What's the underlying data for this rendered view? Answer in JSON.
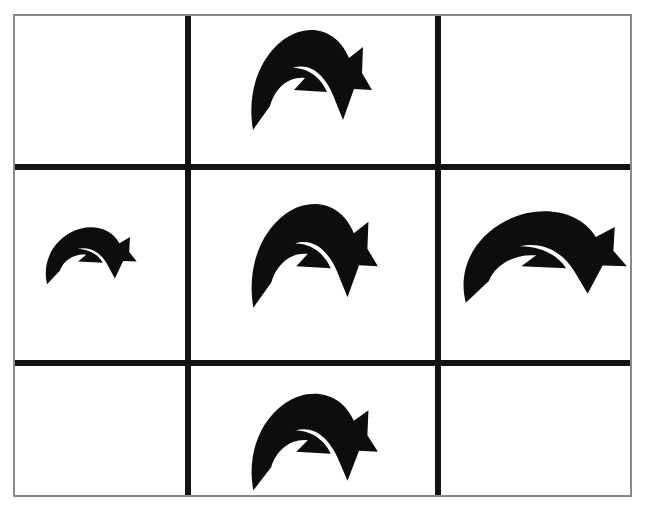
{
  "figure": {
    "background_color": "#ffffff",
    "frame_color": "#8a8a8a",
    "grid_line_color": "#121212",
    "arrow_color": "#0d0d0d",
    "rows": 3,
    "columns": 3,
    "frame": {
      "left": 13,
      "top": 14,
      "width": 619,
      "height": 483
    },
    "grid_lines": {
      "vertical": [
        {
          "name": "vertical-divider-left",
          "x": 170,
          "thickness": 6
        },
        {
          "name": "vertical-divider-right",
          "x": 420,
          "thickness": 6
        }
      ],
      "horizontal": [
        {
          "name": "horizontal-divider-top",
          "y": 148,
          "thickness": 6
        },
        {
          "name": "horizontal-divider-bottom",
          "y": 344,
          "thickness": 6
        }
      ]
    },
    "cells": [
      {
        "id": "cell-r1c1",
        "row": 1,
        "column": 1,
        "label": "top-left",
        "content": "empty"
      },
      {
        "id": "cell-r1c2",
        "row": 1,
        "column": 2,
        "label": "top-center",
        "content": "curved-arrow"
      },
      {
        "id": "cell-r1c3",
        "row": 1,
        "column": 3,
        "label": "top-right",
        "content": "empty"
      },
      {
        "id": "cell-r2c1",
        "row": 2,
        "column": 1,
        "label": "middle-left",
        "content": "curved-arrow"
      },
      {
        "id": "cell-r2c2",
        "row": 2,
        "column": 2,
        "label": "middle-center",
        "content": "curved-arrow"
      },
      {
        "id": "cell-r2c3",
        "row": 2,
        "column": 3,
        "label": "middle-right",
        "content": "curved-arrow"
      },
      {
        "id": "cell-r3c1",
        "row": 3,
        "column": 1,
        "label": "bottom-left",
        "content": "empty"
      },
      {
        "id": "cell-r3c2",
        "row": 3,
        "column": 2,
        "label": "bottom-center",
        "content": "curved-arrow"
      },
      {
        "id": "cell-r3c3",
        "row": 3,
        "column": 3,
        "label": "bottom-right",
        "content": "empty"
      }
    ],
    "arrows": [
      {
        "id": "arrow-top-center",
        "icon": "curved-arrow-icon",
        "cell": "cell-r1c2",
        "direction": "clockwise-arc-down-right",
        "size": "medium",
        "left": 245,
        "top": 24,
        "width": 130,
        "height": 116
      },
      {
        "id": "arrow-middle-left",
        "icon": "curved-arrow-icon",
        "cell": "cell-r2c1",
        "direction": "clockwise-arc-down-right",
        "size": "small",
        "left": 41,
        "top": 224,
        "width": 98,
        "height": 66
      },
      {
        "id": "arrow-middle-center",
        "icon": "curved-arrow-icon",
        "cell": "cell-r2c2",
        "direction": "clockwise-arc-down-right",
        "size": "medium",
        "left": 245,
        "top": 198,
        "width": 136,
        "height": 120
      },
      {
        "id": "arrow-middle-right",
        "icon": "curved-arrow-icon",
        "cell": "cell-r2c3",
        "direction": "clockwise-arc-down-right",
        "size": "large-wide",
        "left": 455,
        "top": 206,
        "width": 176,
        "height": 106
      },
      {
        "id": "arrow-bottom-center",
        "icon": "curved-arrow-icon",
        "cell": "cell-r3c2",
        "direction": "clockwise-arc-down-right",
        "size": "medium",
        "left": 245,
        "top": 388,
        "width": 136,
        "height": 112
      }
    ]
  }
}
